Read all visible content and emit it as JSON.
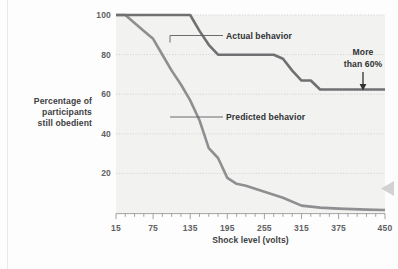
{
  "figure": {
    "name": "milgram-obedience-line-chart",
    "background_color": "#fdfdfd",
    "plot_background_color": "#f2f2f1"
  },
  "annotations": {
    "actual_label": "Actual behavior",
    "predicted_label": "Predicted behavior",
    "callout_line1": "More",
    "callout_line2": "than 60%",
    "scroll_marker": "left-triangle-marker"
  },
  "ylabel_lines": {
    "line1": "Percentage of",
    "line2": "participants",
    "line3": "still obedient"
  },
  "chart_data": {
    "type": "line",
    "title": "",
    "xlabel": "Shock level (volts)",
    "ylabel": "Percentage of participants still obedient",
    "xlim": [
      15,
      450
    ],
    "ylim": [
      0,
      100
    ],
    "xticks": [
      15,
      75,
      135,
      195,
      255,
      315,
      375,
      450
    ],
    "xtick_labels": [
      "15",
      "75",
      "135",
      "195",
      "255",
      "315",
      "375",
      "450"
    ],
    "minor_tick_interval": 15,
    "yticks": [
      20,
      40,
      60,
      80,
      100
    ],
    "ytick_labels": [
      "20",
      "40",
      "60",
      "80",
      "100"
    ],
    "grid": true,
    "grid_axis": "y",
    "legend": "inline-labels",
    "series": [
      {
        "name": "Actual behavior",
        "color": "#6e7072",
        "line_width": 2.6,
        "x": [
          15,
          120,
          135,
          150,
          165,
          180,
          270,
          285,
          300,
          315,
          330,
          345,
          375,
          450
        ],
        "values": [
          100,
          100,
          100,
          92,
          85,
          80,
          80,
          78,
          72,
          67,
          67,
          62.5,
          62.5,
          62.5
        ]
      },
      {
        "name": "Predicted behavior",
        "color": "#8d8f91",
        "line_width": 2.6,
        "x": [
          15,
          30,
          60,
          75,
          90,
          105,
          120,
          135,
          150,
          165,
          180,
          195,
          210,
          225,
          255,
          285,
          315,
          345,
          375,
          420,
          450
        ],
        "values": [
          100,
          100,
          92,
          88,
          80,
          72,
          65,
          57,
          47,
          33,
          28,
          18,
          15,
          14,
          11,
          8,
          4,
          3,
          2.5,
          2,
          1.8
        ]
      }
    ],
    "callouts": [
      {
        "text": "More than 60%",
        "target_series": "Actual behavior",
        "target_x": 405,
        "target_y": 62.5,
        "arrow": "down"
      }
    ]
  }
}
